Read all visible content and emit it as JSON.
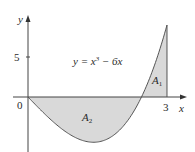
{
  "chart_data": {
    "type": "area",
    "title": "",
    "equation": "y = x³ − 6x",
    "equation_parts": {
      "lhs": "y = x",
      "exp": "3",
      "rhs": " − 6x"
    },
    "xlabel": "x",
    "ylabel": "y",
    "x_ticks": [
      {
        "value": 0,
        "label": "0"
      },
      {
        "value": 3,
        "label": "3"
      }
    ],
    "y_ticks": [
      {
        "value": 5,
        "label": "5"
      }
    ],
    "xlim": [
      -0.33,
      3.4
    ],
    "ylim": [
      -6.9,
      10.1
    ],
    "grid": false,
    "legend": null,
    "function": "x^3 - 6x",
    "domain_shaded": [
      0,
      3
    ],
    "regions": [
      {
        "name": "A1",
        "label_main": "A",
        "label_sub": "1",
        "x_range": [
          2.449,
          3
        ],
        "sign": "positive"
      },
      {
        "name": "A2",
        "label_main": "A",
        "label_sub": "2",
        "x_range": [
          0,
          2.449
        ],
        "sign": "negative"
      }
    ],
    "key_points": [
      {
        "x": 0,
        "y": 0
      },
      {
        "x": 1.414,
        "y": -5.657,
        "note": "minimum"
      },
      {
        "x": 2.449,
        "y": 0,
        "note": "root sqrt(6)"
      },
      {
        "x": 3,
        "y": 9
      }
    ],
    "colors": {
      "fill": "#d9d9d9",
      "curve": "#555555",
      "axis": "#444444"
    }
  }
}
